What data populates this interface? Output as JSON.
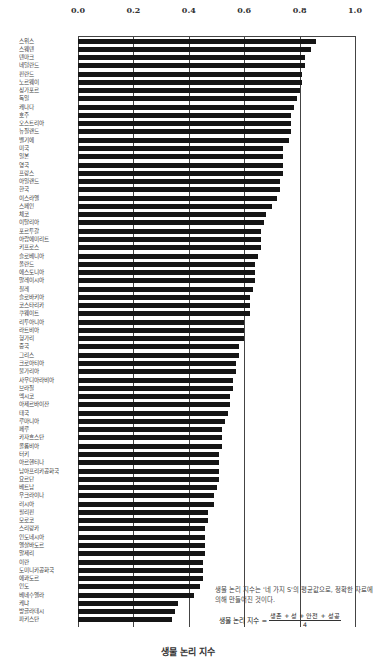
{
  "chart_data": {
    "type": "bar",
    "orientation": "horizontal",
    "title": "",
    "xlabel": "생물 논리 지수",
    "ylabel": "",
    "xlim": [
      0.0,
      1.0
    ],
    "x_ticks": [
      "0.0",
      "0.2",
      "0.4",
      "0.6",
      "0.8",
      "1.0"
    ],
    "grid": true,
    "legend": null,
    "categories": [
      "스위스",
      "스웨덴",
      "덴마크",
      "네덜란드",
      "핀란드",
      "노르웨이",
      "싱가포르",
      "독일",
      "캐나다",
      "호주",
      "오스트리아",
      "뉴질랜드",
      "벨기에",
      "미국",
      "일본",
      "영국",
      "프랑스",
      "아일랜드",
      "한국",
      "이스라엘",
      "스페인",
      "체코",
      "이탈리아",
      "포르투갈",
      "아랍에미리트",
      "키프로스",
      "슬로베니아",
      "폴란드",
      "에스토니아",
      "말레이시아",
      "칠레",
      "슬로바키아",
      "코스타리카",
      "쿠웨이트",
      "리투아니아",
      "라트비아",
      "헝가리",
      "중국",
      "그리스",
      "크로아티아",
      "불가리아",
      "사우디아라비아",
      "브라질",
      "멕시코",
      "아제르바이잔",
      "태국",
      "루마니아",
      "페루",
      "카자흐스탄",
      "콜롬비아",
      "터키",
      "아르헨티나",
      "남아프리카공화국",
      "요르단",
      "베트남",
      "우크라이나",
      "러시아",
      "필리핀",
      "모로코",
      "스리랑카",
      "인도네시아",
      "엘살바도르",
      "알제리",
      "이란",
      "도미니카공화국",
      "에콰도르",
      "인도",
      "베네수엘라",
      "케냐",
      "방글라데시",
      "파키스탄"
    ],
    "values": [
      0.86,
      0.84,
      0.82,
      0.82,
      0.81,
      0.81,
      0.8,
      0.79,
      0.78,
      0.77,
      0.77,
      0.77,
      0.76,
      0.74,
      0.74,
      0.74,
      0.74,
      0.73,
      0.73,
      0.72,
      0.7,
      0.68,
      0.67,
      0.66,
      0.66,
      0.66,
      0.65,
      0.64,
      0.64,
      0.64,
      0.63,
      0.62,
      0.62,
      0.62,
      0.6,
      0.6,
      0.6,
      0.58,
      0.58,
      0.57,
      0.57,
      0.56,
      0.56,
      0.55,
      0.55,
      0.54,
      0.53,
      0.52,
      0.52,
      0.52,
      0.51,
      0.51,
      0.51,
      0.51,
      0.5,
      0.49,
      0.49,
      0.47,
      0.47,
      0.46,
      0.46,
      0.46,
      0.46,
      0.45,
      0.45,
      0.45,
      0.44,
      0.42,
      0.36,
      0.35,
      0.34
    ],
    "annotation": {
      "note": "생물 논리 지수는 '네 가지 S'의 평균값으로, 정확한 자료에 의해 만들어진 것이다.",
      "formula_lhs": "생물 논리 지수 =",
      "formula_numerator": "생존 + 성 + 안전 + 성공",
      "formula_denominator": "4"
    },
    "bar_color": "#151515"
  }
}
